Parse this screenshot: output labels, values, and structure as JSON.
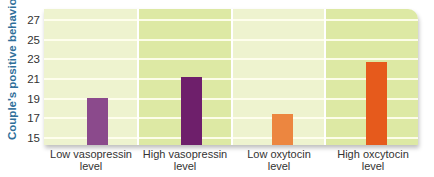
{
  "chart_data": {
    "type": "bar",
    "title": "",
    "xlabel": "",
    "ylabel": "Couple's positive behavior",
    "ylim": [
      15,
      27
    ],
    "yticks": [
      15,
      17,
      19,
      21,
      23,
      25,
      27
    ],
    "grid": true,
    "legend": null,
    "categories": [
      "Low vasopressin level",
      "High vasopressin level",
      "Low oxytocin level",
      "High oxcytocin level"
    ],
    "values": [
      19.7,
      21.8,
      18.1,
      23.4
    ],
    "bar_colors": [
      "#8b4a8c",
      "#6e1f6b",
      "#ec8640",
      "#e65a1c"
    ]
  },
  "axis": {
    "ylabel": "Couple's positive behavior",
    "ticks": [
      "27",
      "25",
      "23",
      "21",
      "19",
      "17",
      "15"
    ]
  },
  "categories": [
    {
      "line1": "Low vasopressin",
      "line2": "level"
    },
    {
      "line1": "High vasopressin",
      "line2": "level"
    },
    {
      "line1": "Low oxytocin",
      "line2": "level"
    },
    {
      "line1": "High oxcytocin",
      "line2": "level"
    }
  ]
}
